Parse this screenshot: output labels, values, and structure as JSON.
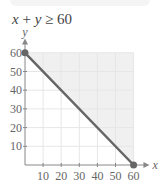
{
  "title": {
    "var1": "x",
    "op1": " + ",
    "var2": "y",
    "op2": " ≥ ",
    "const": "60"
  },
  "chart_data": {
    "type": "line",
    "title": "x + y ≥ 60",
    "xlabel": "x",
    "ylabel": "y",
    "xlim": [
      0,
      60
    ],
    "ylim": [
      0,
      60
    ],
    "x_ticks": [
      10,
      20,
      30,
      40,
      50,
      60
    ],
    "y_ticks": [
      10,
      20,
      30,
      40,
      50,
      60
    ],
    "grid": true,
    "series": [
      {
        "name": "x + y = 60",
        "points": [
          [
            0,
            60
          ],
          [
            60,
            0
          ]
        ],
        "endpoints": "closed",
        "color": "#666666"
      }
    ],
    "shaded_region": {
      "description": "x + y ≥ 60 (above the line)",
      "polygon": [
        [
          0,
          60
        ],
        [
          60,
          60
        ],
        [
          60,
          0
        ]
      ],
      "color": "#f0f0f0"
    }
  },
  "axes": {
    "x_label": "x",
    "y_label": "y",
    "x_ticks": [
      "10",
      "20",
      "30",
      "40",
      "50",
      "60"
    ],
    "y_ticks": [
      "10",
      "20",
      "30",
      "40",
      "50",
      "60"
    ]
  }
}
